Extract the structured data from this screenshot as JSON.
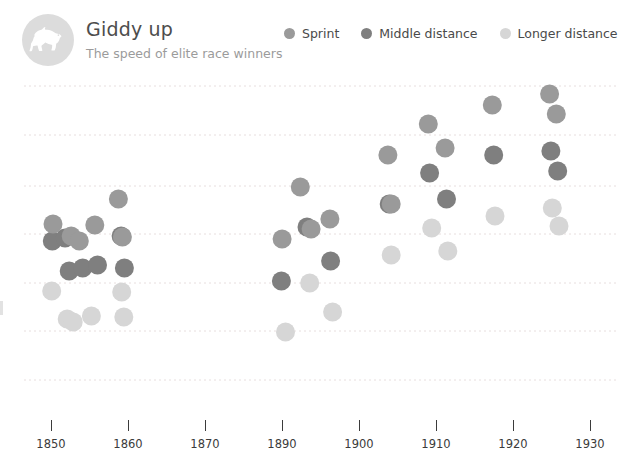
{
  "header": {
    "title": "Giddy up",
    "subtitle": "The speed of elite race winners",
    "logo_icon": "horse-icon"
  },
  "legend": {
    "position": "top-right",
    "items": [
      {
        "label": "Sprint",
        "color": "#9a9a9a"
      },
      {
        "label": "Middle distance",
        "color": "#7f7f7f"
      },
      {
        "label": "Longer distance",
        "color": "#d6d6d6"
      }
    ]
  },
  "colors": {
    "sprint": "#9a9a9a",
    "middle": "#7f7f7f",
    "longer": "#d6d6d6",
    "gridline": "#e7dede",
    "axis_text": "#3b3b3b",
    "title_text": "#4d4d4d",
    "subtitle_text": "#9b9b9b",
    "badge": "#dcdcdc"
  },
  "chart_data": {
    "type": "scatter",
    "title": "Giddy up",
    "subtitle": "The speed of elite race winners",
    "xlabel": "",
    "ylabel": "",
    "xlim": [
      1845,
      1933
    ],
    "ylim": [
      0,
      7
    ],
    "grid": true,
    "legend_position": "top-right",
    "xticks": [
      1850,
      1860,
      1870,
      1890,
      1900,
      1910,
      1920,
      1930
    ],
    "xtick_labels": [
      "1850",
      "1860",
      "1870",
      "1890",
      "1900",
      "1910",
      "1920",
      "1930"
    ],
    "gridlines_y": [
      6,
      5,
      4,
      3,
      2,
      1,
      0
    ],
    "note": "y axis labels are cropped out of the visible screenshot; y positions given in pixel-equivalent chart units",
    "series": [
      {
        "name": "Sprint",
        "color": "#9a9a9a",
        "points": [
          {
            "x": 1850.3,
            "y": 224
          },
          {
            "x": 1853.0,
            "y": 236
          },
          {
            "x": 1854.2,
            "y": 241
          },
          {
            "x": 1856.5,
            "y": 225
          },
          {
            "x": 1860.0,
            "y": 199
          },
          {
            "x": 1860.6,
            "y": 237
          },
          {
            "x": 1884.3,
            "y": 239
          },
          {
            "x": 1887.0,
            "y": 187
          },
          {
            "x": 1888.6,
            "y": 229
          },
          {
            "x": 1891.4,
            "y": 219
          },
          {
            "x": 1900.0,
            "y": 155
          },
          {
            "x": 1900.5,
            "y": 204
          },
          {
            "x": 1906.0,
            "y": 124
          },
          {
            "x": 1908.5,
            "y": 148
          },
          {
            "x": 1915.5,
            "y": 105
          },
          {
            "x": 1924.0,
            "y": 94
          },
          {
            "x": 1925.0,
            "y": 114
          }
        ]
      },
      {
        "name": "Middle distance",
        "color": "#7f7f7f",
        "points": [
          {
            "x": 1850.2,
            "y": 241
          },
          {
            "x": 1852.1,
            "y": 238
          },
          {
            "x": 1852.7,
            "y": 271
          },
          {
            "x": 1854.7,
            "y": 268
          },
          {
            "x": 1856.9,
            "y": 265
          },
          {
            "x": 1860.4,
            "y": 236
          },
          {
            "x": 1860.9,
            "y": 268
          },
          {
            "x": 1884.2,
            "y": 281
          },
          {
            "x": 1888.0,
            "y": 227
          },
          {
            "x": 1891.5,
            "y": 261
          },
          {
            "x": 1900.2,
            "y": 204
          },
          {
            "x": 1906.2,
            "y": 173
          },
          {
            "x": 1908.7,
            "y": 199
          },
          {
            "x": 1915.7,
            "y": 155
          },
          {
            "x": 1924.2,
            "y": 151
          },
          {
            "x": 1925.2,
            "y": 171
          }
        ]
      },
      {
        "name": "Longer distance",
        "color": "#d6d6d6",
        "points": [
          {
            "x": 1850.1,
            "y": 291
          },
          {
            "x": 1852.4,
            "y": 319
          },
          {
            "x": 1853.3,
            "y": 322
          },
          {
            "x": 1856.0,
            "y": 316
          },
          {
            "x": 1860.5,
            "y": 292
          },
          {
            "x": 1860.8,
            "y": 317
          },
          {
            "x": 1884.8,
            "y": 332
          },
          {
            "x": 1888.4,
            "y": 283
          },
          {
            "x": 1891.8,
            "y": 312
          },
          {
            "x": 1900.5,
            "y": 255
          },
          {
            "x": 1906.5,
            "y": 228
          },
          {
            "x": 1908.9,
            "y": 251
          },
          {
            "x": 1915.9,
            "y": 216
          },
          {
            "x": 1924.4,
            "y": 208
          },
          {
            "x": 1925.4,
            "y": 226
          }
        ]
      }
    ]
  },
  "xaxis": {
    "ticks": [
      {
        "label": "1850",
        "x": 51
      },
      {
        "label": "1860",
        "x": 128
      },
      {
        "label": "1870",
        "x": 205
      },
      {
        "label": "1890",
        "x": 282
      },
      {
        "label": "1900",
        "x": 359
      },
      {
        "label": "1910",
        "x": 436
      },
      {
        "label": "1920",
        "x": 513
      },
      {
        "label": "1930",
        "x": 590
      }
    ]
  }
}
